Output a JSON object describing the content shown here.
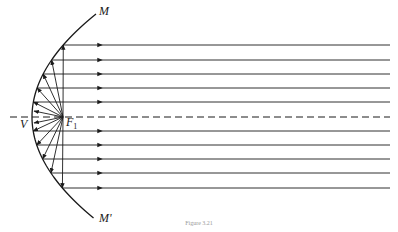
{
  "figure": {
    "caption": "Figure 3.21",
    "labels": {
      "top_end": "M",
      "bottom_end": "M'",
      "vertex": "V",
      "focus": "F",
      "focus_subscript": "1"
    },
    "geometry": {
      "vertex": [
        32,
        117
      ],
      "focus": [
        63,
        117
      ],
      "axis_y": 117,
      "axis_x_start": 10,
      "axis_x_end": 390,
      "ray_end_x": 390,
      "upper_ray_ys": [
        45,
        60,
        74,
        88,
        102
      ],
      "lower_ray_ys": [
        131,
        145,
        159,
        173,
        188
      ],
      "curve_top": [
        96,
        14
      ],
      "curve_bottom": [
        96,
        218
      ]
    },
    "colors": {
      "stroke": "#1a1a1a",
      "background": "#ffffff"
    }
  }
}
